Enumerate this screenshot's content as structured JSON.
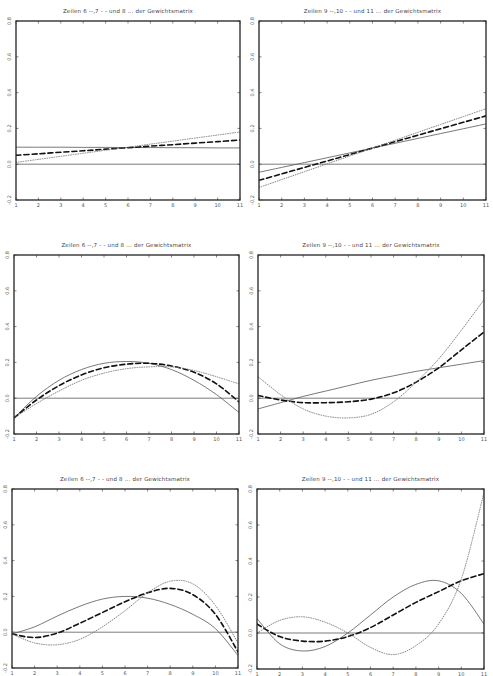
{
  "panels": [
    {
      "id": "p1",
      "title": "Zeilen 6 --,7 - -  und 8 ... der Gewichtsmatrix",
      "frame": {
        "x": 16,
        "y": 21,
        "w": 224,
        "h": 179
      }
    },
    {
      "id": "p2",
      "title": "Zeilen 9 --,10 - -  und 11 ... der Gewichtsmatrix",
      "frame": {
        "x": 259,
        "y": 21,
        "w": 227,
        "h": 179
      }
    },
    {
      "id": "p3",
      "title": "Zeilen 6 --,7 - -  und 8 ... der Gewichtsmatrix",
      "frame": {
        "x": 14,
        "y": 255,
        "w": 225,
        "h": 179
      }
    },
    {
      "id": "p4",
      "title": "Zeilen 9 --,10 - -  und 11 ... der Gewichtsmatrix",
      "frame": {
        "x": 258,
        "y": 255,
        "w": 226,
        "h": 179
      }
    },
    {
      "id": "p5",
      "title": "Zeilen 6 --,7 - -  und 8 ... der Gewichtsmatrix",
      "frame": {
        "x": 12,
        "y": 489,
        "w": 226,
        "h": 179
      }
    },
    {
      "id": "p6",
      "title": "Zeilen 9 --,10 - -  und 11 ... der Gewichtsmatrix",
      "frame": {
        "x": 257,
        "y": 489,
        "w": 227,
        "h": 180
      }
    }
  ],
  "chart_data": [
    {
      "type": "line",
      "title": "Zeilen 6 --,7 - -  und 8 ... der Gewichtsmatrix",
      "xlabel": "",
      "ylabel": "",
      "x": [
        1,
        2,
        3,
        4,
        5,
        6,
        7,
        8,
        9,
        10,
        11
      ],
      "xticks": [
        "1",
        "2",
        "3",
        "4",
        "5",
        "6",
        "7",
        "8",
        "9",
        "10",
        "11"
      ],
      "yticks": [
        "-0.2",
        "0.0",
        "0.2",
        "0.4",
        "0.6",
        "0.8"
      ],
      "xlim": [
        1,
        11
      ],
      "ylim": [
        -0.2,
        0.8
      ],
      "grid": false,
      "legend": "in title",
      "reference_line": 0.0,
      "series": [
        {
          "name": "Zeile 6",
          "style": "solid",
          "values": [
            0.095,
            0.095,
            0.095,
            0.094,
            0.094,
            0.093,
            0.093,
            0.092,
            0.092,
            0.091,
            0.091
          ]
        },
        {
          "name": "Zeile 7",
          "style": "dashed",
          "values": [
            0.05,
            0.058,
            0.067,
            0.075,
            0.084,
            0.092,
            0.101,
            0.109,
            0.118,
            0.126,
            0.135
          ]
        },
        {
          "name": "Zeile 8",
          "style": "dotted",
          "values": [
            0.01,
            0.027,
            0.044,
            0.061,
            0.078,
            0.095,
            0.112,
            0.129,
            0.146,
            0.163,
            0.18
          ]
        }
      ]
    },
    {
      "type": "line",
      "title": "Zeilen 9 --,10 - -  und 11 ... der Gewichtsmatrix",
      "xlabel": "",
      "ylabel": "",
      "x": [
        1,
        2,
        3,
        4,
        5,
        6,
        7,
        8,
        9,
        10,
        11
      ],
      "xticks": [
        "1",
        "2",
        "3",
        "4",
        "5",
        "6",
        "7",
        "8",
        "9",
        "10",
        "11"
      ],
      "yticks": [
        "-0.2",
        "0.0",
        "0.2",
        "0.4",
        "0.6",
        "0.8"
      ],
      "xlim": [
        1,
        11
      ],
      "ylim": [
        -0.2,
        0.8
      ],
      "grid": false,
      "legend": "in title",
      "reference_line": 0.0,
      "series": [
        {
          "name": "Zeile 9",
          "style": "solid",
          "values": [
            -0.045,
            -0.018,
            0.009,
            0.036,
            0.063,
            0.09,
            0.117,
            0.144,
            0.171,
            0.198,
            0.225
          ]
        },
        {
          "name": "Zeile 10",
          "style": "dashed",
          "values": [
            -0.09,
            -0.054,
            -0.018,
            0.018,
            0.054,
            0.09,
            0.126,
            0.162,
            0.198,
            0.234,
            0.27
          ]
        },
        {
          "name": "Zeile 11",
          "style": "dotted",
          "values": [
            -0.13,
            -0.086,
            -0.042,
            0.002,
            0.046,
            0.09,
            0.134,
            0.178,
            0.222,
            0.266,
            0.31
          ]
        }
      ]
    },
    {
      "type": "line",
      "title": "Zeilen 6 --,7 - -  und 8 ... der Gewichtsmatrix",
      "xlabel": "",
      "ylabel": "",
      "x": [
        1,
        2,
        3,
        4,
        5,
        6,
        7,
        8,
        9,
        10,
        11
      ],
      "xticks": [
        "1",
        "2",
        "3",
        "4",
        "5",
        "6",
        "7",
        "8",
        "9",
        "10",
        "11"
      ],
      "yticks": [
        "-0.2",
        "0.0",
        "0.2",
        "0.4",
        "0.6",
        "0.8"
      ],
      "xlim": [
        1,
        11
      ],
      "ylim": [
        -0.2,
        0.8
      ],
      "grid": false,
      "legend": "in title",
      "reference_line": 0.0,
      "series": [
        {
          "name": "Zeile 6",
          "style": "solid",
          "values": [
            -0.11,
            0.01,
            0.1,
            0.16,
            0.195,
            0.205,
            0.195,
            0.16,
            0.1,
            0.02,
            -0.08
          ]
        },
        {
          "name": "Zeile 7",
          "style": "dashed",
          "values": [
            -0.11,
            -0.01,
            0.07,
            0.13,
            0.17,
            0.19,
            0.195,
            0.18,
            0.145,
            0.08,
            -0.02
          ]
        },
        {
          "name": "Zeile 8",
          "style": "dotted",
          "values": [
            -0.11,
            -0.03,
            0.04,
            0.1,
            0.14,
            0.165,
            0.175,
            0.175,
            0.155,
            0.12,
            0.08
          ]
        }
      ]
    },
    {
      "type": "line",
      "title": "Zeilen 9 --,10 - -  und 11 ... der Gewichtsmatrix",
      "xlabel": "",
      "ylabel": "",
      "x": [
        1,
        2,
        3,
        4,
        5,
        6,
        7,
        8,
        9,
        10,
        11
      ],
      "xticks": [
        "1",
        "2",
        "3",
        "4",
        "5",
        "6",
        "7",
        "8",
        "9",
        "10",
        "11"
      ],
      "yticks": [
        "-0.2",
        "0.0",
        "0.2",
        "0.4",
        "0.6",
        "0.8"
      ],
      "xlim": [
        1,
        11
      ],
      "ylim": [
        -0.2,
        0.8
      ],
      "grid": false,
      "legend": "in title",
      "reference_line": 0.0,
      "series": [
        {
          "name": "Zeile 9",
          "style": "solid",
          "values": [
            -0.06,
            -0.025,
            0.01,
            0.04,
            0.07,
            0.1,
            0.125,
            0.15,
            0.17,
            0.19,
            0.21
          ]
        },
        {
          "name": "Zeile 10",
          "style": "dashed",
          "values": [
            0.015,
            -0.01,
            -0.025,
            -0.025,
            -0.02,
            -0.005,
            0.03,
            0.09,
            0.17,
            0.27,
            0.37
          ]
        },
        {
          "name": "Zeile 11",
          "style": "dotted",
          "values": [
            0.12,
            0.02,
            -0.06,
            -0.1,
            -0.11,
            -0.09,
            -0.02,
            0.09,
            0.22,
            0.38,
            0.55
          ]
        }
      ]
    },
    {
      "type": "line",
      "title": "Zeilen 6 --,7 - -  und 8 ... der Gewichtsmatrix",
      "xlabel": "",
      "ylabel": "",
      "x": [
        1,
        2,
        3,
        4,
        5,
        6,
        7,
        8,
        9,
        10,
        11
      ],
      "xticks": [
        "1",
        "2",
        "3",
        "4",
        "5",
        "6",
        "7",
        "8",
        "9",
        "10",
        "11"
      ],
      "yticks": [
        "-0.2",
        "0.0",
        "0.2",
        "0.4",
        "0.6",
        "0.8"
      ],
      "xlim": [
        1,
        11
      ],
      "ylim": [
        -0.2,
        0.8
      ],
      "grid": false,
      "legend": "in title",
      "reference_line": 0.0,
      "series": [
        {
          "name": "Zeile 6",
          "style": "solid",
          "values": [
            -0.01,
            0.03,
            0.09,
            0.145,
            0.185,
            0.2,
            0.19,
            0.155,
            0.1,
            0.02,
            -0.13
          ]
        },
        {
          "name": "Zeile 7",
          "style": "dashed",
          "values": [
            -0.01,
            -0.03,
            -0.005,
            0.05,
            0.11,
            0.17,
            0.22,
            0.245,
            0.21,
            0.1,
            -0.11
          ]
        },
        {
          "name": "Zeile 8",
          "style": "dotted",
          "values": [
            -0.01,
            -0.06,
            -0.07,
            -0.04,
            0.03,
            0.12,
            0.22,
            0.285,
            0.27,
            0.15,
            -0.06
          ]
        }
      ]
    },
    {
      "type": "line",
      "title": "Zeilen 9 --,10 - -  und 11 ... der Gewichtsmatrix",
      "xlabel": "",
      "ylabel": "",
      "x": [
        1,
        2,
        3,
        4,
        5,
        6,
        7,
        8,
        9,
        10,
        11
      ],
      "xticks": [
        "1",
        "2",
        "3",
        "4",
        "5",
        "6",
        "7",
        "8",
        "9",
        "10",
        "11"
      ],
      "yticks": [
        "-0.2",
        "0.0",
        "0.2",
        "0.4",
        "0.6",
        "0.8"
      ],
      "xlim": [
        1,
        11
      ],
      "ylim": [
        -0.2,
        0.8
      ],
      "grid": false,
      "legend": "in title",
      "reference_line": 0.0,
      "series": [
        {
          "name": "Zeile 9",
          "style": "solid",
          "values": [
            0.08,
            -0.06,
            -0.1,
            -0.075,
            0.0,
            0.1,
            0.2,
            0.27,
            0.29,
            0.22,
            0.05
          ]
        },
        {
          "name": "Zeile 10",
          "style": "dashed",
          "values": [
            0.05,
            -0.02,
            -0.045,
            -0.045,
            -0.02,
            0.03,
            0.1,
            0.17,
            0.23,
            0.29,
            0.33
          ]
        },
        {
          "name": "Zeile 11",
          "style": "dotted",
          "values": [
            0.0,
            0.07,
            0.09,
            0.06,
            0.0,
            -0.08,
            -0.12,
            -0.07,
            0.05,
            0.3,
            0.78
          ]
        }
      ]
    }
  ]
}
